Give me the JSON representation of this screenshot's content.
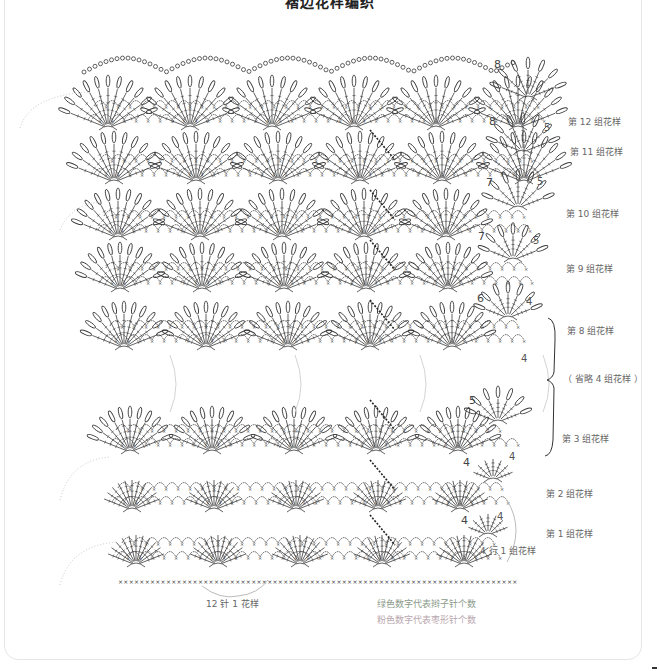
{
  "title": "褶边花样编织",
  "row_labels": [
    {
      "text": "第 12 组花样",
      "x": 568,
      "y": 121
    },
    {
      "text": "第 11 组花样",
      "x": 570,
      "y": 151
    },
    {
      "text": "第 10 组花样",
      "x": 566,
      "y": 213
    },
    {
      "text": "第 9 组花样",
      "x": 566,
      "y": 268
    },
    {
      "text": "第 8 组花样",
      "x": 567,
      "y": 330
    },
    {
      "text": "（ 省略 4 组花样 ）",
      "x": 563,
      "y": 378
    },
    {
      "text": "第 3 组花样",
      "x": 562,
      "y": 438
    },
    {
      "text": "第 2 组花样",
      "x": 546,
      "y": 493
    },
    {
      "text": "第 1 组花样",
      "x": 546,
      "y": 533
    },
    {
      "text": "4 行 1 组花样",
      "x": 480,
      "y": 550
    }
  ],
  "stitch_count_marks": {
    "green_numbers": [
      {
        "text": "8",
        "x": 494,
        "y": 68
      },
      {
        "text": "8",
        "x": 489,
        "y": 125
      },
      {
        "text": "7",
        "x": 486,
        "y": 186
      },
      {
        "text": "7",
        "x": 478,
        "y": 240
      },
      {
        "text": "6",
        "x": 477,
        "y": 302
      },
      {
        "text": "5",
        "x": 469,
        "y": 404
      },
      {
        "text": "4",
        "x": 463,
        "y": 466
      },
      {
        "text": "4",
        "x": 461,
        "y": 524
      }
    ],
    "pink_numbers": [
      {
        "text": "5",
        "x": 544,
        "y": 131
      },
      {
        "text": "5",
        "x": 537,
        "y": 185
      },
      {
        "text": "5",
        "x": 533,
        "y": 244
      },
      {
        "text": "4",
        "x": 526,
        "y": 305
      },
      {
        "text": "4",
        "x": 521,
        "y": 362
      },
      {
        "text": "4",
        "x": 509,
        "y": 460
      },
      {
        "text": "4",
        "x": 497,
        "y": 520
      }
    ]
  },
  "bottom_labels": {
    "repeat": "12 针 1 花样",
    "legend_green": "绿色数字代表辫子针个数",
    "legend_pink": "粉色数字代表枣形针个数"
  },
  "colors": {
    "stitch": "#3a3a3a",
    "guide_dots": "#c8c8c8",
    "label": "#666666",
    "legend_green": "#8a9a8a",
    "legend_pink": "#b9a6ae",
    "border": "#e6e6e6"
  }
}
